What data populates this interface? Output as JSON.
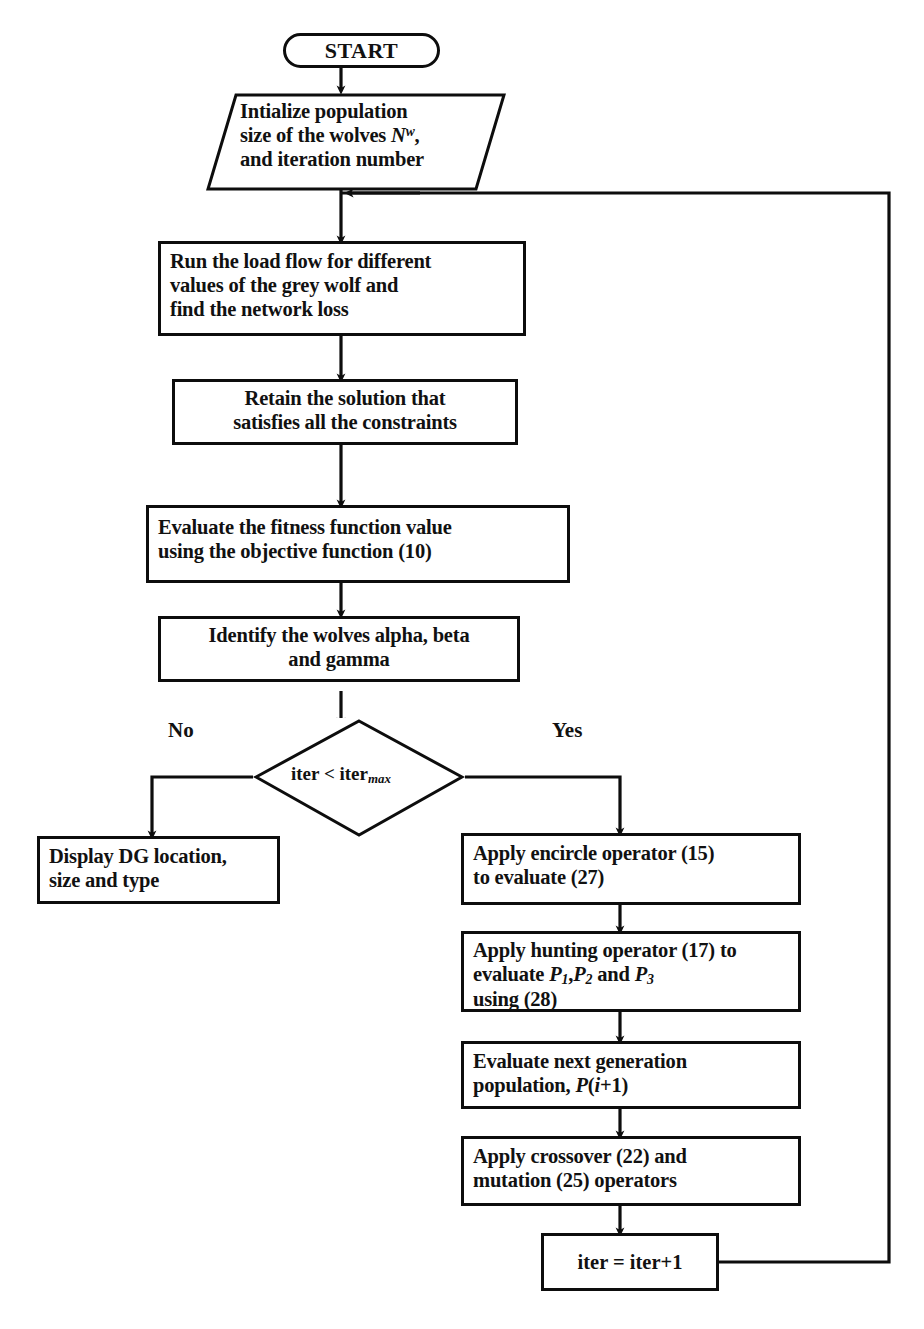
{
  "diagram": {
    "stroke_color": "#0d0d0d",
    "background_color": "#ffffff"
  },
  "nodes": {
    "start": {
      "label": "START",
      "shape": "terminal"
    },
    "initialize": {
      "shape": "parallelogram",
      "line1": "Intialize population",
      "line2_a": "size of the wolves ",
      "line2_var": "N",
      "line2_sup": "w",
      "line2_b": ",",
      "line3": "and iteration number"
    },
    "load_flow": {
      "shape": "process",
      "line1": "Run the load flow for different",
      "line2": "values of the grey wolf and",
      "line3": "find the network loss"
    },
    "retain": {
      "shape": "process",
      "line1": "Retain the solution that",
      "line2": "satisfies all the constraints"
    },
    "fitness": {
      "shape": "process",
      "line1": "Evaluate the fitness function value",
      "line2": "using the objective function (10)"
    },
    "identify": {
      "shape": "process",
      "line1": "Identify the wolves alpha, beta",
      "line2": "and gamma"
    },
    "decision": {
      "shape": "diamond",
      "text_a": "iter < iter",
      "text_sub": "max",
      "yes_label": "Yes",
      "no_label": "No"
    },
    "display": {
      "shape": "process",
      "line1": "Display DG location,",
      "line2": "size and type"
    },
    "encircle": {
      "shape": "process",
      "line1": "Apply encircle operator (15)",
      "line2": "to evaluate (27)"
    },
    "hunting": {
      "shape": "process",
      "line1": "Apply hunting operator (17) to",
      "line2_a": "evaluate ",
      "line2_p1": "P",
      "line2_s1": "1",
      "line2_comma": ",",
      "line2_p2": "P",
      "line2_s2": "2",
      "line2_and": " and ",
      "line2_p3": "P",
      "line2_s3": "3",
      "line3": "using (28)"
    },
    "next_gen": {
      "shape": "process",
      "line1": "Evaluate next generation",
      "line2_a": "population, ",
      "line2_p": "P",
      "line2_open": "(",
      "line2_i": "i",
      "line2_rest": "+1)"
    },
    "crossover": {
      "shape": "process",
      "line1": "Apply crossover (22) and",
      "line2": "mutation (25) operators"
    },
    "increment": {
      "shape": "process",
      "label": "iter = iter+1"
    }
  }
}
